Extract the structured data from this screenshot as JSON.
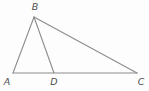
{
  "figure": {
    "stroke_color": "#8c8c8c",
    "label_color": "#4d4d4d",
    "stroke_width": 1.1,
    "width": 149,
    "height": 91,
    "vertices": {
      "A": {
        "x": 13,
        "y": 73
      },
      "B": {
        "x": 34,
        "y": 17
      },
      "C": {
        "x": 137,
        "y": 73
      },
      "D": {
        "x": 54,
        "y": 73
      }
    },
    "edges": [
      {
        "name": "edge-AB",
        "from": "A",
        "to": "B"
      },
      {
        "name": "edge-BC",
        "from": "B",
        "to": "C"
      },
      {
        "name": "edge-AC",
        "from": "A",
        "to": "C"
      },
      {
        "name": "cevian-BD",
        "from": "B",
        "to": "D"
      }
    ],
    "labels": [
      {
        "text": "A",
        "x": 7,
        "y": 85,
        "anchor": "middle"
      },
      {
        "text": "B",
        "x": 35,
        "y": 10,
        "anchor": "middle"
      },
      {
        "text": "D",
        "x": 54,
        "y": 85,
        "anchor": "middle"
      },
      {
        "text": "C",
        "x": 141,
        "y": 85,
        "anchor": "middle"
      }
    ]
  }
}
